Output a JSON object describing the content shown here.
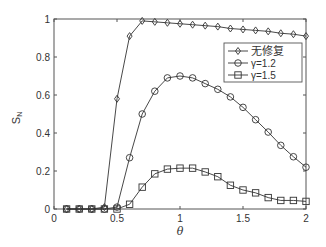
{
  "chart_data": {
    "type": "line",
    "title": "",
    "xlabel": "θ",
    "ylabel": "S_N",
    "xlim": [
      0,
      2
    ],
    "ylim": [
      0,
      1
    ],
    "grid": false,
    "legend_position": "upper right (inside)",
    "x_ticks": [
      "0",
      "0.5",
      "1",
      "1.5",
      "2"
    ],
    "y_ticks": [
      "0",
      "0.2",
      "0.4",
      "0.6",
      "0.8",
      "1"
    ],
    "x": [
      0.1,
      0.2,
      0.3,
      0.4,
      0.5,
      0.6,
      0.7,
      0.8,
      0.9,
      1.0,
      1.1,
      1.2,
      1.3,
      1.4,
      1.5,
      1.6,
      1.7,
      1.8,
      1.9,
      2.0
    ],
    "series": [
      {
        "name": "无修复",
        "marker": "diamond",
        "values": [
          0,
          0,
          0,
          0.01,
          0.58,
          0.91,
          0.99,
          0.985,
          0.98,
          0.975,
          0.97,
          0.965,
          0.96,
          0.95,
          0.945,
          0.94,
          0.935,
          0.925,
          0.92,
          0.91
        ]
      },
      {
        "name": "γ=1.2",
        "marker": "circle",
        "values": [
          0,
          0,
          0,
          0,
          0.01,
          0.27,
          0.5,
          0.62,
          0.69,
          0.7,
          0.69,
          0.66,
          0.63,
          0.59,
          0.535,
          0.47,
          0.405,
          0.335,
          0.275,
          0.22
        ]
      },
      {
        "name": "γ=1.5",
        "marker": "square",
        "values": [
          0,
          0,
          0,
          0,
          0,
          0.025,
          0.115,
          0.185,
          0.21,
          0.215,
          0.215,
          0.195,
          0.17,
          0.125,
          0.1,
          0.085,
          0.06,
          0.045,
          0.045,
          0.04
        ]
      }
    ]
  },
  "colors": {
    "line": "#333333",
    "axis": "#555555",
    "background": "#ffffff"
  }
}
